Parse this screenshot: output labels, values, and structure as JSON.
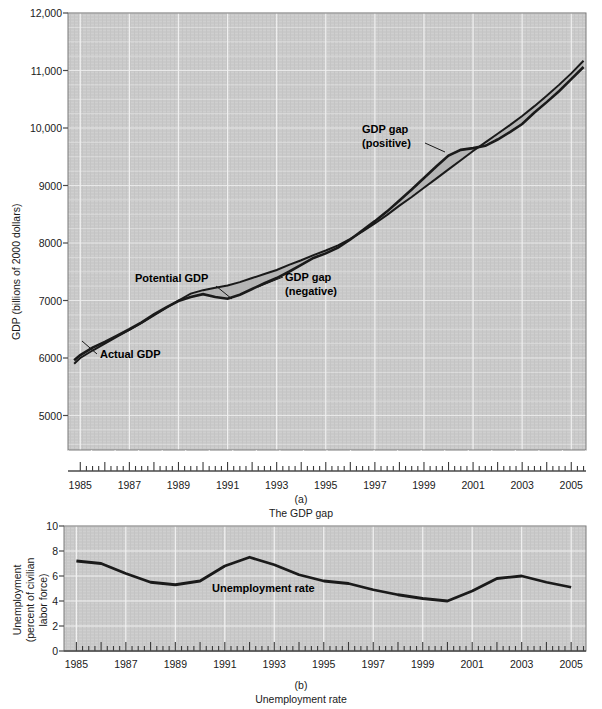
{
  "figure": {
    "panel_a": {
      "caption_letter": "(a)",
      "caption_text": "The GDP gap",
      "ylabel": "GDP (billions of 2000 dollars)",
      "y_ticks": [
        "5000",
        "6000",
        "7000",
        "8000",
        "9000",
        "10,000",
        "11,000",
        "12,000"
      ],
      "x_ticks": [
        "1985",
        "1987",
        "1989",
        "1991",
        "1993",
        "1995",
        "1997",
        "1999",
        "2001",
        "2003",
        "2005"
      ],
      "annotations": {
        "actual": "Actual GDP",
        "potential": "Potential GDP",
        "gap_negative_line1": "GDP gap",
        "gap_negative_line2": "(negative)",
        "gap_positive_line1": "GDP gap",
        "gap_positive_line2": "(positive)"
      }
    },
    "panel_b": {
      "caption_letter": "(b)",
      "caption_text": "Unemployment rate",
      "ylabel_line1": "Unemployment",
      "ylabel_line2": "(percent of civilian",
      "ylabel_line3": "labor force)",
      "y_ticks": [
        "0",
        "2",
        "4",
        "6",
        "8",
        "10"
      ],
      "x_ticks": [
        "1985",
        "1987",
        "1989",
        "1991",
        "1993",
        "1995",
        "1997",
        "1999",
        "2001",
        "2003",
        "2005"
      ],
      "annotations": {
        "series": "Unemployment rate"
      }
    },
    "colors": {
      "plot_background": "#c9c9c9",
      "gridline": "#f2f2f2",
      "line": "#1a1a1a",
      "gap_fill": "#b3b3b3",
      "axis": "#6b6b6b",
      "text": "#1a1a1a"
    }
  },
  "chart_data": [
    {
      "type": "area",
      "panel": "a",
      "title": "The GDP gap",
      "xlabel": "",
      "ylabel": "GDP (billions of 2000 dollars)",
      "xlim": [
        1984.5,
        2005.6
      ],
      "ylim": [
        4400,
        12000
      ],
      "y_axis_break": true,
      "grid": true,
      "legend_position": "inline-annotations",
      "x": [
        1984.75,
        1985,
        1985.5,
        1986,
        1986.5,
        1987,
        1987.5,
        1988,
        1988.5,
        1989,
        1989.5,
        1990,
        1990.5,
        1991,
        1991.5,
        1992,
        1992.5,
        1993,
        1993.5,
        1994,
        1994.5,
        1995,
        1995.5,
        1996,
        1996.5,
        1997,
        1997.5,
        1998,
        1998.5,
        1999,
        1999.5,
        2000,
        2000.5,
        2001,
        2001.5,
        2002,
        2002.5,
        2003,
        2003.5,
        2004,
        2004.5,
        2005,
        2005.5
      ],
      "series": [
        {
          "name": "Actual GDP",
          "values": [
            5960,
            6050,
            6180,
            6280,
            6390,
            6500,
            6620,
            6760,
            6880,
            6990,
            7060,
            7110,
            7060,
            7030,
            7100,
            7200,
            7300,
            7390,
            7500,
            7620,
            7740,
            7820,
            7920,
            8060,
            8220,
            8380,
            8550,
            8740,
            8930,
            9130,
            9330,
            9520,
            9620,
            9650,
            9690,
            9800,
            9930,
            10070,
            10270,
            10450,
            10640,
            10850,
            11060
          ]
        },
        {
          "name": "Potential GDP",
          "values": [
            5900,
            6000,
            6130,
            6250,
            6370,
            6490,
            6610,
            6740,
            6870,
            7000,
            7120,
            7180,
            7220,
            7260,
            7320,
            7390,
            7460,
            7530,
            7620,
            7700,
            7790,
            7870,
            7960,
            8070,
            8200,
            8340,
            8490,
            8650,
            8800,
            8960,
            9120,
            9280,
            9440,
            9600,
            9750,
            9900,
            10050,
            10210,
            10380,
            10560,
            10750,
            10950,
            11170
          ]
        }
      ],
      "notes": "Shaded region between Actual and Potential GDP is the GDP gap. Negative gap (Actual below Potential) ~1990-1996; positive gap (Actual above Potential) ~1997-2001; negative again ~2002-2005."
    },
    {
      "type": "line",
      "panel": "b",
      "title": "Unemployment rate",
      "xlabel": "",
      "ylabel": "Unemployment (percent of civilian labor force)",
      "xlim": [
        1984.5,
        2005.6
      ],
      "ylim": [
        0,
        10
      ],
      "grid": true,
      "x": [
        1985,
        1986,
        1987,
        1988,
        1989,
        1990,
        1991,
        1992,
        1993,
        1994,
        1995,
        1996,
        1997,
        1998,
        1999,
        2000,
        2001,
        2002,
        2003,
        2004,
        2005
      ],
      "series": [
        {
          "name": "Unemployment rate",
          "values": [
            7.2,
            7.0,
            6.2,
            5.5,
            5.3,
            5.6,
            6.8,
            7.5,
            6.9,
            6.1,
            5.6,
            5.4,
            4.9,
            4.5,
            4.2,
            4.0,
            4.8,
            5.8,
            6.0,
            5.5,
            5.1
          ]
        }
      ]
    }
  ]
}
